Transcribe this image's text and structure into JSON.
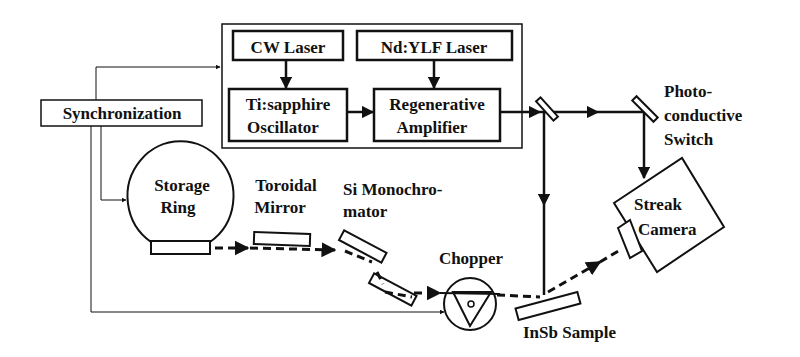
{
  "diagram": {
    "type": "experimental-setup-schematic",
    "colors": {
      "stroke": "#111111",
      "background": "#ffffff"
    },
    "boxes": {
      "cw_laser": "CW Laser",
      "ndylf_laser": "Nd:YLF Laser",
      "ti_sapphire_line1": "Ti:sapphire",
      "ti_sapphire_line2": "Oscillator",
      "regen_line1": "Regenerative",
      "regen_line2": "Amplifier",
      "synchronization": "Synchronization"
    },
    "labels": {
      "storage_ring_line1": "Storage",
      "storage_ring_line2": "Ring",
      "toroidal_line1": "Toroidal",
      "toroidal_line2": "Mirror",
      "mono_line1": "Si Monochro-",
      "mono_line2": "mator",
      "chopper": "Chopper",
      "insb_sample": "InSb Sample",
      "photo_line1": "Photo-",
      "photo_line2": "conductive",
      "photo_line3": "Switch",
      "streak_line1": "Streak",
      "streak_line2": "Camera"
    },
    "connections": [
      {
        "from": "CW Laser",
        "to": "Ti:sapphire Oscillator",
        "style": "solid-arrow"
      },
      {
        "from": "Nd:YLF Laser",
        "to": "Regenerative Amplifier",
        "style": "solid-arrow"
      },
      {
        "from": "Ti:sapphire Oscillator",
        "to": "Regenerative Amplifier",
        "style": "solid-arrow"
      },
      {
        "from": "Regenerative Amplifier",
        "to": "Beam splitter",
        "style": "solid-arrow"
      },
      {
        "from": "Beam splitter",
        "to": "Photoconductive Switch",
        "style": "solid-arrow"
      },
      {
        "from": "Photoconductive Switch",
        "to": "Streak Camera",
        "style": "solid-arrow"
      },
      {
        "from": "Beam splitter",
        "to": "InSb Sample",
        "style": "solid-arrow"
      },
      {
        "from": "Storage Ring",
        "to": "Toroidal Mirror",
        "style": "dashed-arrow"
      },
      {
        "from": "Toroidal Mirror",
        "to": "Si Monochromator",
        "style": "dashed-arrow"
      },
      {
        "from": "Si Monochromator",
        "to": "Chopper",
        "style": "dashed-arrow"
      },
      {
        "from": "Chopper",
        "to": "InSb Sample",
        "style": "dashed"
      },
      {
        "from": "InSb Sample",
        "to": "Streak Camera",
        "style": "dashed-arrow"
      },
      {
        "from": "Synchronization",
        "to": "Laser system",
        "style": "thin-arrow"
      },
      {
        "from": "Synchronization",
        "to": "Storage Ring",
        "style": "thin-arrow"
      },
      {
        "from": "Synchronization",
        "to": "Chopper",
        "style": "thin-arrow"
      }
    ]
  }
}
